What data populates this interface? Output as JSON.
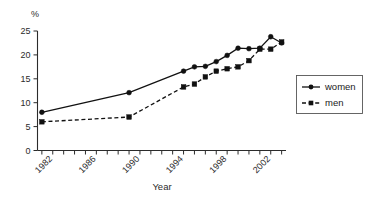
{
  "chart_data": {
    "type": "line",
    "title": "",
    "xlabel": "Year",
    "ylabel": "%",
    "unit_label": "%",
    "x": [
      1981,
      1989,
      1994,
      1995,
      1996,
      1997,
      1998,
      1999,
      2000,
      2001,
      2002,
      2003
    ],
    "xlim": [
      1980.6,
      2003.4
    ],
    "ylim": [
      0,
      25
    ],
    "grid": false,
    "legend_position": "right",
    "x_tick_values": [
      1981,
      1982,
      1983,
      1984,
      1985,
      1986,
      1987,
      1988,
      1989,
      1990,
      1991,
      1992,
      1993,
      1994,
      1995,
      1996,
      1997,
      1998,
      1999,
      2000,
      2001,
      2002,
      2003
    ],
    "x_tick_labels": [
      "1982",
      "1986",
      "1990",
      "1994",
      "1998",
      "2002"
    ],
    "x_labeled_values": [
      1982,
      1986,
      1990,
      1994,
      1998,
      2002
    ],
    "y_tick_values": [
      0,
      5,
      10,
      15,
      20,
      25
    ],
    "y_tick_labels": [
      "0",
      "5",
      "10",
      "15",
      "20",
      "25"
    ],
    "series": [
      {
        "name": "women",
        "marker": "circle",
        "linestyle": "solid",
        "values": [
          8.0,
          12.1,
          16.6,
          17.5,
          17.6,
          18.6,
          19.9,
          21.4,
          21.3,
          21.4,
          23.8,
          22.5
        ]
      },
      {
        "name": "men",
        "marker": "square",
        "linestyle": "dashed",
        "values": [
          6.0,
          7.0,
          13.3,
          13.9,
          15.4,
          16.6,
          17.1,
          17.5,
          18.8,
          21.2,
          21.2,
          22.7
        ]
      }
    ]
  },
  "legend": {
    "entries": [
      {
        "label": "women",
        "marker": "circle",
        "linestyle": "solid"
      },
      {
        "label": "men",
        "marker": "square",
        "linestyle": "dashed"
      }
    ]
  },
  "axis": {
    "x_title": "Year",
    "y_unit": "%"
  }
}
